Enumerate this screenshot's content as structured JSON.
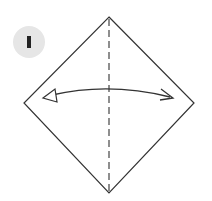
{
  "step": {
    "number": "1",
    "badge_color": "#e6e6e6",
    "number_color": "#222222"
  },
  "diagram": {
    "line_color": "#333333",
    "shapes": {
      "diamond": {
        "top": [
          109,
          17
        ],
        "right": [
          194,
          103
        ],
        "bottom": [
          109,
          193
        ],
        "left": [
          24,
          103
        ]
      },
      "fold_line": {
        "type": "valley-dashed",
        "x": 109,
        "y1": 17,
        "y2": 193
      },
      "arrow": {
        "type": "fold-unfold",
        "from": [
          45,
          98
        ],
        "to": [
          172,
          98
        ],
        "left_head": "hollow-triangle",
        "right_head": "open-v"
      }
    }
  }
}
